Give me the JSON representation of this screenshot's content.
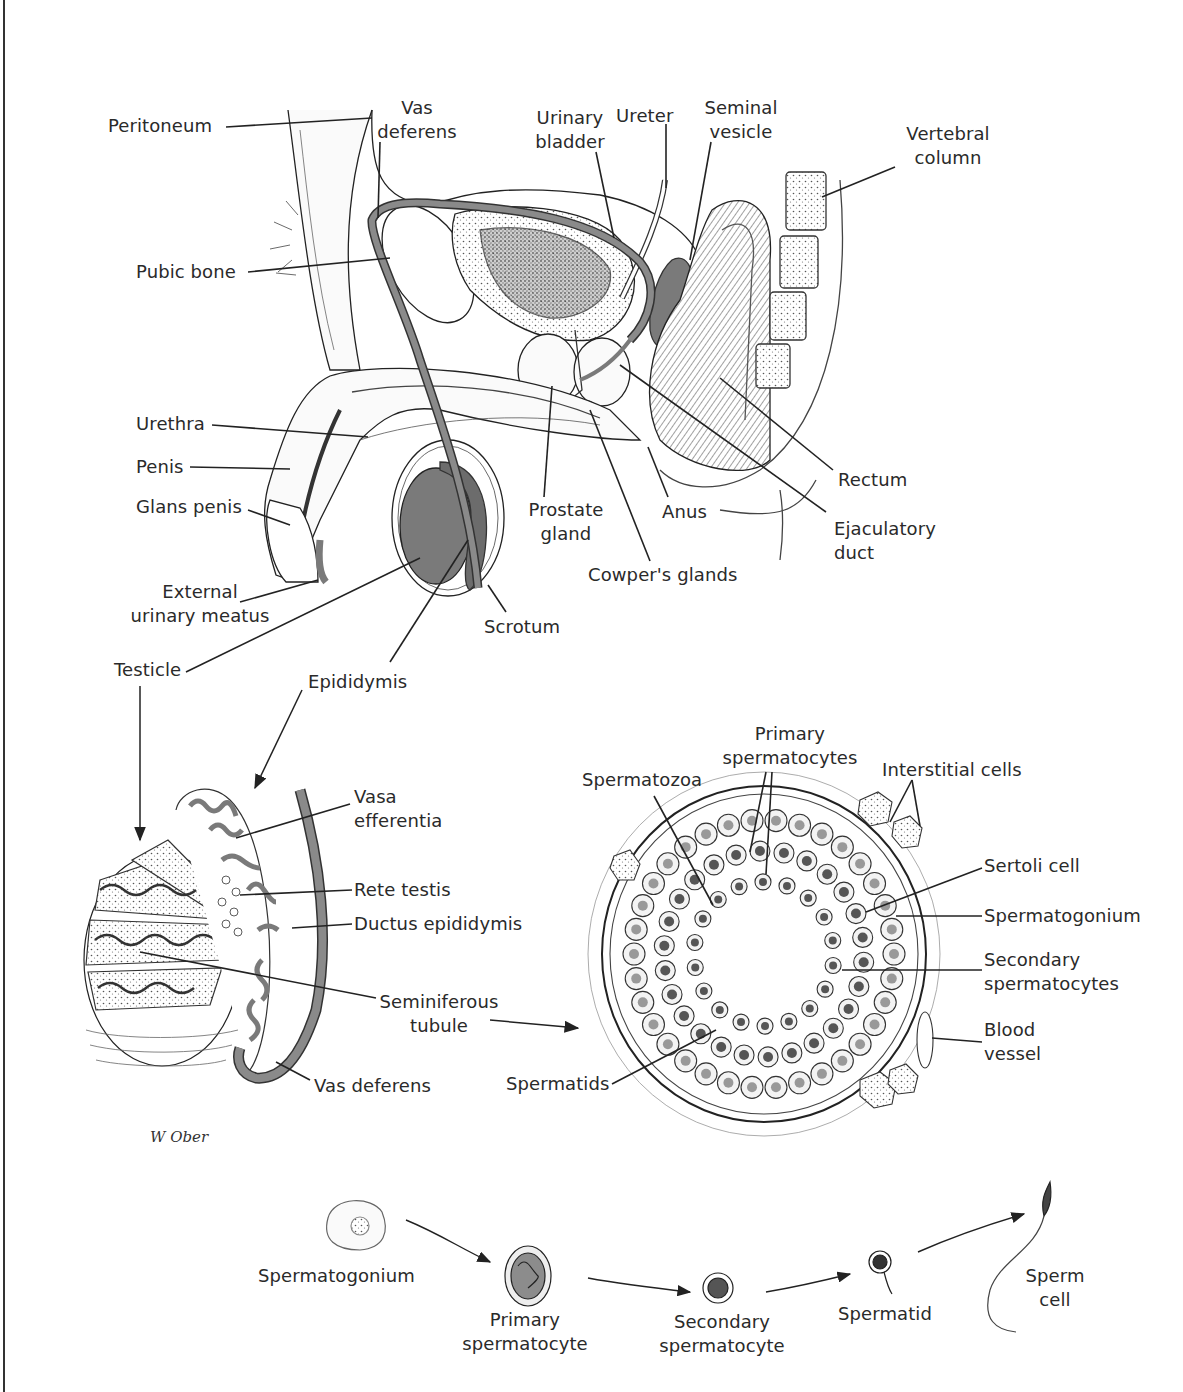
{
  "figure": {
    "signature": "W Ober",
    "colors": {
      "ink": "#222222",
      "gray_fill": "#7a7a7a",
      "tissue": "#f4f4f4",
      "background": "#ffffff"
    }
  },
  "sagittal_view": {
    "labels": [
      {
        "id": "peritoneum",
        "text": "Peritoneum",
        "x": 108,
        "y": 114,
        "align": "l",
        "line": [
          226,
          127,
          372,
          118
        ]
      },
      {
        "id": "vas-deferens",
        "text": "Vas\ndeferens",
        "x": 357,
        "y": 96,
        "align": "c",
        "w": 120,
        "line": [
          380,
          142,
          378,
          218
        ]
      },
      {
        "id": "urinary-bladder",
        "text": "Urinary\nbladder",
        "x": 525,
        "y": 106,
        "align": "c",
        "w": 90,
        "line": [
          596,
          152,
          614,
          238
        ]
      },
      {
        "id": "ureter",
        "text": "Ureter",
        "x": 616,
        "y": 104,
        "align": "l",
        "line": [
          666,
          124,
          666,
          188
        ]
      },
      {
        "id": "seminal-vesicle",
        "text": "Seminal\nvesicle",
        "x": 695,
        "y": 96,
        "align": "c",
        "w": 92,
        "line": [
          711,
          142,
          690,
          260
        ]
      },
      {
        "id": "vertebral-column",
        "text": "Vertebral\ncolumn",
        "x": 888,
        "y": 122,
        "align": "c",
        "w": 120,
        "line": [
          895,
          167,
          822,
          197
        ]
      },
      {
        "id": "pubic-bone",
        "text": "Pubic bone",
        "x": 136,
        "y": 260,
        "align": "l",
        "line": [
          248,
          272,
          390,
          258
        ]
      },
      {
        "id": "urethra",
        "text": "Urethra",
        "x": 136,
        "y": 412,
        "align": "l",
        "line": [
          212,
          425,
          368,
          437
        ]
      },
      {
        "id": "penis",
        "text": "Penis",
        "x": 136,
        "y": 455,
        "align": "l",
        "line": [
          190,
          467,
          290,
          469
        ]
      },
      {
        "id": "glans-penis",
        "text": "Glans penis",
        "x": 136,
        "y": 495,
        "align": "l",
        "line": [
          248,
          510,
          290,
          525
        ]
      },
      {
        "id": "external-urinary-meatus",
        "text": "External\nurinary meatus",
        "x": 120,
        "y": 580,
        "align": "c",
        "w": 160,
        "line": [
          240,
          602,
          318,
          580
        ]
      },
      {
        "id": "scrotum",
        "text": "Scrotum",
        "x": 484,
        "y": 615,
        "align": "l",
        "line": [
          506,
          612,
          488,
          585
        ]
      },
      {
        "id": "testicle",
        "text": "Testicle",
        "x": 114,
        "y": 658,
        "align": "l",
        "line": [
          186,
          672,
          420,
          558
        ]
      },
      {
        "id": "epididymis",
        "text": "Epididymis",
        "x": 308,
        "y": 670,
        "align": "l",
        "line": [
          390,
          662,
          468,
          540
        ]
      },
      {
        "id": "prostate-gland",
        "text": "Prostate\ngland",
        "x": 520,
        "y": 498,
        "align": "c",
        "w": 92,
        "line": [
          544,
          497,
          552,
          386
        ]
      },
      {
        "id": "cowpers-glands",
        "text": "Cowper's glands",
        "x": 588,
        "y": 563,
        "align": "l",
        "line": [
          650,
          561,
          590,
          410
        ]
      },
      {
        "id": "anus",
        "text": "Anus",
        "x": 662,
        "y": 500,
        "align": "l",
        "line": [
          668,
          497,
          648,
          447
        ]
      },
      {
        "id": "rectum",
        "text": "Rectum",
        "x": 838,
        "y": 468,
        "align": "l",
        "line": [
          833,
          470,
          720,
          378
        ]
      },
      {
        "id": "ejaculatory-duct",
        "text": "Ejaculatory\nduct",
        "x": 834,
        "y": 517,
        "align": "l",
        "line": [
          826,
          512,
          620,
          365
        ]
      }
    ]
  },
  "testis_section": {
    "labels": [
      {
        "id": "vasa-efferentia",
        "text": "Vasa\nefferentia",
        "x": 354,
        "y": 785,
        "align": "l",
        "line": [
          350,
          804,
          236,
          838
        ]
      },
      {
        "id": "rete-testis",
        "text": "Rete testis",
        "x": 354,
        "y": 878,
        "align": "l",
        "line": [
          352,
          890,
          240,
          895
        ]
      },
      {
        "id": "ductus-epididymis",
        "text": "Ductus epididymis",
        "x": 354,
        "y": 912,
        "align": "l",
        "line": [
          352,
          924,
          292,
          928
        ]
      },
      {
        "id": "seminiferous-tubule",
        "text": "Seminiferous\ntubule",
        "x": 376,
        "y": 990,
        "align": "c",
        "w": 126,
        "line": [
          376,
          998,
          140,
          952
        ]
      },
      {
        "id": "vas-deferens-2",
        "text": "Vas deferens",
        "x": 314,
        "y": 1074,
        "align": "l",
        "line": [
          310,
          1080,
          276,
          1062
        ]
      }
    ]
  },
  "tubule_section": {
    "labels": [
      {
        "id": "primary-spermatocytes",
        "text": "Primary\nspermatocytes",
        "x": 710,
        "y": 722,
        "align": "c",
        "w": 160,
        "line": null
      },
      {
        "id": "spermatozoa",
        "text": "Spermatozoa",
        "x": 582,
        "y": 768,
        "align": "l",
        "line": [
          654,
          796,
          713,
          905
        ]
      },
      {
        "id": "interstitial-cells",
        "text": "Interstitial cells",
        "x": 882,
        "y": 758,
        "align": "l",
        "line": null
      },
      {
        "id": "sertoli-cell",
        "text": "Sertoli cell",
        "x": 984,
        "y": 854,
        "align": "l",
        "line": [
          982,
          868,
          866,
          912
        ]
      },
      {
        "id": "spermatogonium",
        "text": "Spermatogonium",
        "x": 984,
        "y": 904,
        "align": "l",
        "line": [
          982,
          916,
          896,
          916
        ]
      },
      {
        "id": "secondary-spermatocytes",
        "text": "Secondary\nspermatocytes",
        "x": 984,
        "y": 948,
        "align": "l",
        "line": [
          982,
          970,
          842,
          970
        ]
      },
      {
        "id": "blood-vessel",
        "text": "Blood\nvessel",
        "x": 984,
        "y": 1018,
        "align": "l",
        "line": [
          982,
          1042,
          932,
          1038
        ]
      },
      {
        "id": "spermatids",
        "text": "Spermatids",
        "x": 506,
        "y": 1072,
        "align": "l",
        "line": [
          612,
          1084,
          716,
          1030
        ]
      }
    ],
    "multi_leaders": [
      [
        766,
        772,
        750,
        852
      ],
      [
        772,
        772,
        766,
        874
      ],
      [
        912,
        780,
        890,
        822
      ],
      [
        912,
        780,
        920,
        826
      ]
    ],
    "arrow_from_testis": [
      566,
      1020,
      582,
      1022
    ]
  },
  "spermatogenesis_sequence": {
    "stages": [
      {
        "id": "spermatogonium",
        "text": "Spermatogonium",
        "x": 258,
        "y": 1264,
        "align": "l"
      },
      {
        "id": "primary-spermatocyte",
        "text": "Primary\nspermatocyte",
        "x": 460,
        "y": 1308,
        "align": "c",
        "w": 130
      },
      {
        "id": "secondary-spermatocyte",
        "text": "Secondary\nspermatocyte",
        "x": 654,
        "y": 1310,
        "align": "c",
        "w": 136
      },
      {
        "id": "spermatid",
        "text": "Spermatid",
        "x": 838,
        "y": 1302,
        "align": "l"
      },
      {
        "id": "sperm-cell",
        "text": "Sperm\ncell",
        "x": 1018,
        "y": 1264,
        "align": "c",
        "w": 74
      }
    ]
  }
}
